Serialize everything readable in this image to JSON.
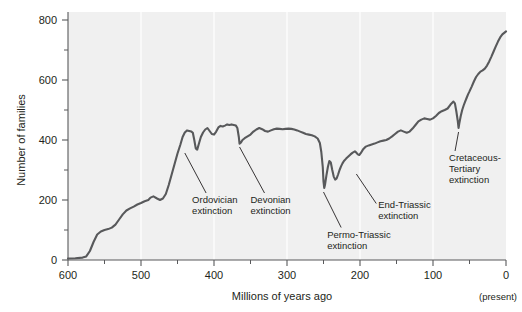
{
  "chart_data": {
    "type": "line",
    "title": "",
    "xlabel": "Millions of years ago",
    "ylabel": "Number of families",
    "xlim": [
      600,
      0
    ],
    "ylim": [
      0,
      800
    ],
    "x_ticks": [
      600,
      500,
      400,
      300,
      200,
      100,
      0
    ],
    "x_tick_labels": [
      "600",
      "500",
      "400",
      "300",
      "200",
      "100",
      "0"
    ],
    "x_minor_ticks": [
      550,
      450,
      350,
      250,
      150,
      50
    ],
    "y_ticks": [
      0,
      200,
      400,
      600,
      800
    ],
    "y_tick_labels": [
      "0",
      "200",
      "400",
      "600",
      "800"
    ],
    "y_minor_ticks": [
      100,
      300,
      500,
      700
    ],
    "x_axis_note": "(present)",
    "x_axis_note_at": 0,
    "grid": "vertical-only",
    "legend": "none",
    "series": [
      {
        "name": "Number of marine animal families",
        "color": "#58595b",
        "points": [
          [
            600,
            5
          ],
          [
            590,
            6
          ],
          [
            580,
            8
          ],
          [
            575,
            12
          ],
          [
            570,
            30
          ],
          [
            565,
            60
          ],
          [
            560,
            85
          ],
          [
            555,
            95
          ],
          [
            550,
            100
          ],
          [
            545,
            103
          ],
          [
            540,
            108
          ],
          [
            535,
            118
          ],
          [
            530,
            135
          ],
          [
            525,
            152
          ],
          [
            520,
            165
          ],
          [
            515,
            172
          ],
          [
            510,
            178
          ],
          [
            505,
            185
          ],
          [
            500,
            190
          ],
          [
            495,
            196
          ],
          [
            490,
            200
          ],
          [
            487,
            208
          ],
          [
            483,
            212
          ],
          [
            478,
            205
          ],
          [
            474,
            200
          ],
          [
            470,
            205
          ],
          [
            466,
            220
          ],
          [
            462,
            250
          ],
          [
            458,
            285
          ],
          [
            454,
            320
          ],
          [
            450,
            355
          ],
          [
            446,
            385
          ],
          [
            443,
            410
          ],
          [
            440,
            425
          ],
          [
            437,
            432
          ],
          [
            434,
            430
          ],
          [
            431,
            428
          ],
          [
            429,
            424
          ],
          [
            427,
            400
          ],
          [
            425,
            372
          ],
          [
            423,
            368
          ],
          [
            421,
            385
          ],
          [
            418,
            410
          ],
          [
            415,
            425
          ],
          [
            412,
            435
          ],
          [
            409,
            440
          ],
          [
            406,
            430
          ],
          [
            403,
            420
          ],
          [
            400,
            418
          ],
          [
            397,
            428
          ],
          [
            394,
            442
          ],
          [
            391,
            447
          ],
          [
            388,
            445
          ],
          [
            385,
            448
          ],
          [
            382,
            452
          ],
          [
            379,
            450
          ],
          [
            376,
            452
          ],
          [
            373,
            450
          ],
          [
            370,
            448
          ],
          [
            368,
            440
          ],
          [
            366,
            410
          ],
          [
            365,
            388
          ],
          [
            363,
            392
          ],
          [
            361,
            400
          ],
          [
            358,
            406
          ],
          [
            354,
            412
          ],
          [
            350,
            418
          ],
          [
            346,
            428
          ],
          [
            342,
            435
          ],
          [
            338,
            440
          ],
          [
            334,
            436
          ],
          [
            330,
            430
          ],
          [
            326,
            428
          ],
          [
            322,
            432
          ],
          [
            318,
            436
          ],
          [
            314,
            438
          ],
          [
            310,
            437
          ],
          [
            306,
            436
          ],
          [
            302,
            437
          ],
          [
            298,
            438
          ],
          [
            294,
            437
          ],
          [
            290,
            435
          ],
          [
            286,
            432
          ],
          [
            282,
            428
          ],
          [
            278,
            424
          ],
          [
            274,
            420
          ],
          [
            270,
            418
          ],
          [
            266,
            416
          ],
          [
            262,
            412
          ],
          [
            258,
            405
          ],
          [
            255,
            390
          ],
          [
            253,
            360
          ],
          [
            251,
            310
          ],
          [
            250,
            262
          ],
          [
            249,
            240
          ],
          [
            248,
            250
          ],
          [
            246,
            282
          ],
          [
            244,
            310
          ],
          [
            242,
            330
          ],
          [
            240,
            325
          ],
          [
            238,
            300
          ],
          [
            236,
            278
          ],
          [
            234,
            268
          ],
          [
            232,
            272
          ],
          [
            230,
            285
          ],
          [
            228,
            300
          ],
          [
            226,
            312
          ],
          [
            224,
            322
          ],
          [
            222,
            330
          ],
          [
            219,
            338
          ],
          [
            216,
            345
          ],
          [
            213,
            352
          ],
          [
            210,
            358
          ],
          [
            207,
            362
          ],
          [
            205,
            358
          ],
          [
            203,
            352
          ],
          [
            201,
            350
          ],
          [
            199,
            356
          ],
          [
            196,
            368
          ],
          [
            192,
            378
          ],
          [
            188,
            382
          ],
          [
            184,
            385
          ],
          [
            180,
            388
          ],
          [
            176,
            392
          ],
          [
            172,
            396
          ],
          [
            168,
            398
          ],
          [
            164,
            400
          ],
          [
            160,
            405
          ],
          [
            156,
            412
          ],
          [
            152,
            420
          ],
          [
            148,
            428
          ],
          [
            144,
            432
          ],
          [
            140,
            428
          ],
          [
            136,
            424
          ],
          [
            132,
            428
          ],
          [
            128,
            438
          ],
          [
            124,
            450
          ],
          [
            120,
            462
          ],
          [
            116,
            468
          ],
          [
            112,
            472
          ],
          [
            108,
            470
          ],
          [
            104,
            468
          ],
          [
            100,
            472
          ],
          [
            96,
            480
          ],
          [
            92,
            490
          ],
          [
            88,
            496
          ],
          [
            84,
            500
          ],
          [
            80,
            505
          ],
          [
            76,
            518
          ],
          [
            72,
            528
          ],
          [
            70,
            522
          ],
          [
            68,
            495
          ],
          [
            66,
            462
          ],
          [
            65,
            440
          ],
          [
            64,
            455
          ],
          [
            62,
            480
          ],
          [
            60,
            500
          ],
          [
            58,
            515
          ],
          [
            56,
            528
          ],
          [
            54,
            540
          ],
          [
            52,
            552
          ],
          [
            50,
            562
          ],
          [
            47,
            578
          ],
          [
            44,
            595
          ],
          [
            41,
            610
          ],
          [
            38,
            620
          ],
          [
            35,
            628
          ],
          [
            32,
            632
          ],
          [
            29,
            638
          ],
          [
            26,
            648
          ],
          [
            23,
            662
          ],
          [
            20,
            678
          ],
          [
            17,
            695
          ],
          [
            14,
            712
          ],
          [
            11,
            728
          ],
          [
            8,
            742
          ],
          [
            5,
            752
          ],
          [
            2,
            758
          ],
          [
            0,
            762
          ]
        ]
      }
    ],
    "annotations": [
      {
        "id": "ordovician",
        "label_lines": [
          "Ordovician",
          "extinction"
        ],
        "event_x": 440,
        "event_y": 370,
        "text_x": 430,
        "text_y": 190
      },
      {
        "id": "devonian",
        "label_lines": [
          "Devonian",
          "extinction"
        ],
        "event_x": 365,
        "event_y": 390,
        "text_x": 350,
        "text_y": 190
      },
      {
        "id": "permo-triassic",
        "label_lines": [
          "Permo-Triassic",
          "extinction"
        ],
        "event_x": 250,
        "event_y": 240,
        "text_x": 245,
        "text_y": 75
      },
      {
        "id": "end-triassic",
        "label_lines": [
          "End-Triassic",
          "extinction"
        ],
        "event_x": 205,
        "event_y": 300,
        "text_x": 175,
        "text_y": 175
      },
      {
        "id": "cretaceous-tertiary",
        "label_lines": [
          "Cretaceous-",
          "Tertiary",
          "extinction"
        ],
        "event_x": 65,
        "event_y": 440,
        "text_x": 78,
        "text_y": 330
      }
    ],
    "colors": {
      "plot_background": "#f0f0f0",
      "line": "#58595b",
      "axis": "#58595b",
      "gridline": "#ffffff",
      "text": "#231f20",
      "page_background": "#ffffff"
    }
  }
}
